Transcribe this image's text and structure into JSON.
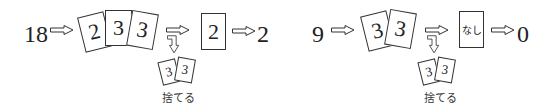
{
  "diagrams": [
    {
      "input": "18",
      "hand_cards": [
        "2",
        "3",
        "3"
      ],
      "discarded_cards": [
        "3",
        "3"
      ],
      "discard_label": "捨てる",
      "remaining_card": "2",
      "output": "2"
    },
    {
      "input": "9",
      "hand_cards": [
        "3",
        "3"
      ],
      "discarded_cards": [
        "3",
        "3"
      ],
      "discard_label": "捨てる",
      "remaining_card": "なし",
      "output": "0"
    }
  ],
  "icons": {
    "arrow": "hollow-right-arrow",
    "down_arrow": "hollow-bent-down-arrow"
  }
}
